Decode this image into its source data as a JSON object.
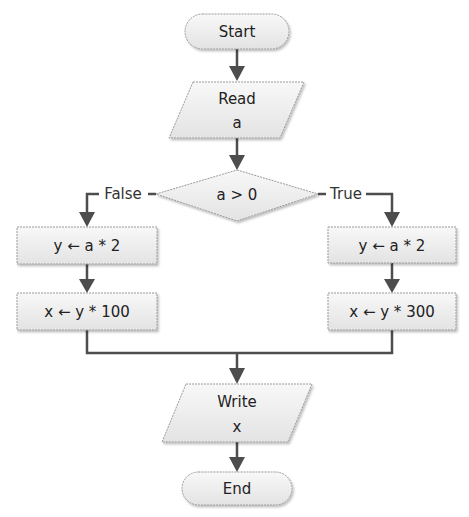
{
  "diagram": {
    "type": "flowchart",
    "nodes": {
      "start": {
        "shape": "terminator",
        "text": "Start"
      },
      "read": {
        "shape": "input-output",
        "line1": "Read",
        "line2": "a"
      },
      "decision": {
        "shape": "decision",
        "text": "a > 0"
      },
      "false_assign_y": {
        "shape": "process",
        "text": "y ← a * 2"
      },
      "false_assign_x": {
        "shape": "process",
        "text": "x ← y * 100"
      },
      "true_assign_y": {
        "shape": "process",
        "text": "y ← a * 2"
      },
      "true_assign_x": {
        "shape": "process",
        "text": "x ← y * 300"
      },
      "write": {
        "shape": "input-output",
        "line1": "Write",
        "line2": "x"
      },
      "end": {
        "shape": "terminator",
        "text": "End"
      }
    },
    "edges": {
      "false_label": "False",
      "true_label": "True"
    },
    "colors": {
      "fill_top": "#f7f7f7",
      "fill_bottom": "#e4e4e4",
      "stroke": "#9a9a9a",
      "arrow": "#4d4d4d",
      "text": "#222222"
    }
  }
}
